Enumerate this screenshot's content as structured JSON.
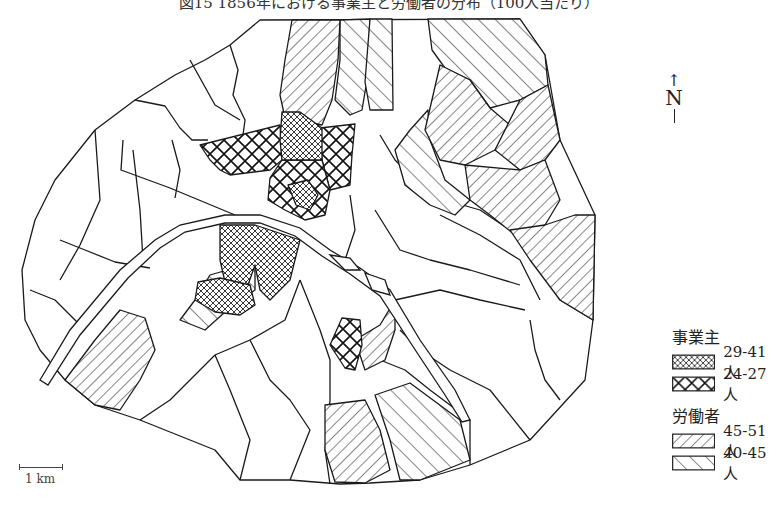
{
  "title": "図15 1856年における事業主と労働者の分布（100人当たり）",
  "north_arrow": {
    "arrow": "↑",
    "label": "N"
  },
  "scale_bar": {
    "label": "1 km"
  },
  "legend": {
    "groups": [
      {
        "title": "事業主",
        "items": [
          {
            "pattern": "fine-crosshatch",
            "label": "29-41人"
          },
          {
            "pattern": "coarse-crosshatch",
            "label": "24-27人"
          }
        ]
      },
      {
        "title": "労働者",
        "items": [
          {
            "pattern": "forward-diagonal",
            "label": "45-51人"
          },
          {
            "pattern": "backward-diagonal",
            "label": "40-45人"
          }
        ]
      }
    ]
  },
  "colors": {
    "line": "#1a1a1a",
    "background": "#ffffff"
  }
}
